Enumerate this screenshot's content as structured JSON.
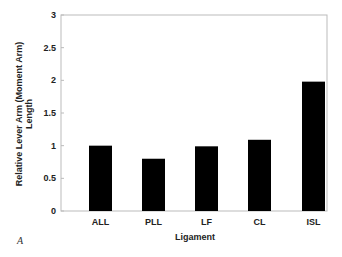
{
  "chart_data": {
    "type": "bar",
    "title": "",
    "categories": [
      "ALL",
      "PLL",
      "LF",
      "CL",
      "ISL"
    ],
    "values": [
      1.0,
      0.8,
      0.99,
      1.09,
      1.98
    ],
    "xlabel": "Ligament",
    "ylabel_line1": "Relative Lever Arm (Moment Arm)",
    "ylabel_line2": "Length",
    "ylim": [
      0,
      3
    ],
    "yticks": [
      0,
      0.5,
      1,
      1.5,
      2,
      2.5,
      3
    ],
    "ytick_labels": [
      "0",
      "0.5",
      "1",
      "1.5",
      "2",
      "2.5",
      "3"
    ],
    "grid": false,
    "legend": null,
    "bar_color": "#000000",
    "axis_color": "#bbbbbb",
    "panel_label": "A"
  }
}
